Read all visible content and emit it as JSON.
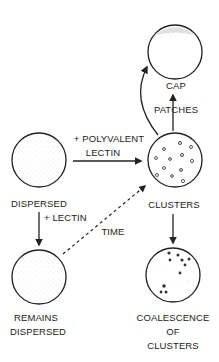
{
  "diagram": {
    "nodes": {
      "cap": {
        "label": "CAP",
        "texture": "dense stipple at top (capped)"
      },
      "dispersed": {
        "label": "DISPERSED",
        "texture": "fine uniform stipple"
      },
      "clusters": {
        "label": "CLUSTERS",
        "texture": "scattered small clusters"
      },
      "remains_dispersed": {
        "label_line1": "REMAINS",
        "label_line2": "DISPERSED",
        "texture": "fine uniform stipple"
      },
      "coalescence": {
        "label_line1": "COALESCENCE",
        "label_line2": "OF",
        "label_line3": "CLUSTERS",
        "texture": "coalesced dark clusters"
      }
    },
    "edges": {
      "polyvalent": {
        "from": "dispersed",
        "to": "clusters",
        "label_line1": "+ POLYVALENT",
        "label_line2": "LECTIN",
        "style": "solid"
      },
      "lectin": {
        "from": "dispersed",
        "to": "remains_dispersed",
        "label": "+ LECTIN",
        "style": "solid"
      },
      "time": {
        "from": "remains_dispersed",
        "to": "clusters",
        "label": "TIME",
        "style": "dashed"
      },
      "patches": {
        "from": "clusters",
        "to": "cap",
        "label": "PATCHES",
        "style": "solid"
      },
      "curved_to_cap": {
        "from": "clusters",
        "to": "cap",
        "label": "",
        "style": "solid curved"
      },
      "coalesce": {
        "from": "clusters",
        "to": "coalescence",
        "label": "",
        "style": "solid"
      }
    },
    "colors": {
      "stroke": "#222222",
      "stipple": "#9a9a9a",
      "cluster": "#444444",
      "background": "#ffffff"
    }
  }
}
